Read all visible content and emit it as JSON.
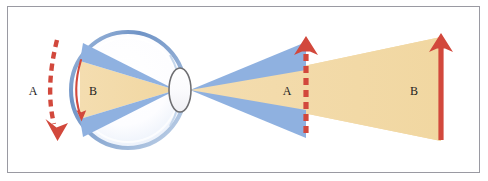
{
  "figure": {
    "domain_kind": "diagram",
    "background_color": "#ffffff",
    "frame": {
      "border_color": "#9a9aa2",
      "fill": "#ffffff"
    }
  },
  "palette": {
    "beam_tan": "#f2d9a6",
    "beam_tan_edge": "#e9cb90",
    "beam_blue": "#8fb1e0",
    "beam_blue_edge": "#7ba1d6",
    "arrow_red": "#d2483c",
    "arc_red": "#d2483c",
    "sclera_fill": "#fdfdff",
    "sclera_edge": "#7d9dc8",
    "lens_fill": "#fbfbfd",
    "lens_edge": "#6f6f72",
    "label_text": "#1d1d1d"
  },
  "labels": {
    "left_arc_label": "A",
    "eye_arc_label": "B",
    "mid_arrow_label": "A",
    "right_arrow_label": "B"
  },
  "annotations": [
    {
      "name": "left-curved-dashed-arrow",
      "label": "A",
      "style": "dashed",
      "color": "#d2483c",
      "direction": "down",
      "shape": "curved",
      "meaning": "retinal image position shift"
    },
    {
      "name": "retinal-image-arc",
      "label": "B",
      "style": "solid",
      "color": "#d2483c",
      "direction": "down",
      "shape": "arc",
      "meaning": "retinal image height"
    },
    {
      "name": "near-object-dashed-arrow",
      "label": "A",
      "style": "dashed",
      "color": "#d2483c",
      "direction": "up",
      "shape": "straight",
      "meaning": "near object height"
    },
    {
      "name": "far-object-solid-arrow",
      "label": "B",
      "style": "solid",
      "color": "#d2483c",
      "direction": "up",
      "shape": "straight",
      "meaning": "far object height"
    }
  ],
  "eye": {
    "name": "eyeball",
    "center_x": 128,
    "center_y": 90,
    "radius_x": 57,
    "radius_y": 58,
    "lens": {
      "name": "lens",
      "center_x": 180,
      "center_y": 90,
      "radius_x": 11,
      "radius_y": 22
    }
  },
  "beams": [
    {
      "name": "tan-cone-outside",
      "color": "#f2d9a6",
      "from": "lens",
      "to": "far-object"
    },
    {
      "name": "blue-cone-outside-upper",
      "color": "#8fb1e0",
      "from": "lens",
      "to": "near-object"
    },
    {
      "name": "blue-cone-outside-lower",
      "color": "#8fb1e0",
      "from": "lens",
      "to": "near-object"
    },
    {
      "name": "tan-cone-inside",
      "color": "#f2d9a6",
      "from": "lens",
      "to": "retina"
    },
    {
      "name": "blue-cone-inside-upper",
      "color": "#8fb1e0",
      "from": "lens",
      "to": "retina"
    },
    {
      "name": "blue-cone-inside-lower",
      "color": "#8fb1e0",
      "from": "lens",
      "to": "retina"
    }
  ]
}
